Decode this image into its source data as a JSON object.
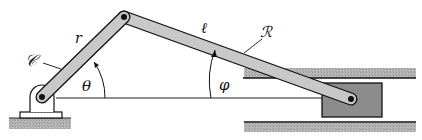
{
  "diagram": {
    "labels": {
      "crank_curve": "𝒞",
      "crank_length": "r",
      "rod_length": "ℓ",
      "rod_curve": "ℛ",
      "crank_angle": "θ",
      "rod_angle": "φ"
    },
    "colors": {
      "link_fill": "#c8c8c8",
      "stroke": "#111111",
      "slider_fill": "#8a8a8a",
      "guide_fill": "#bdbdbd",
      "ground_fill": "#a9a9a9"
    }
  }
}
